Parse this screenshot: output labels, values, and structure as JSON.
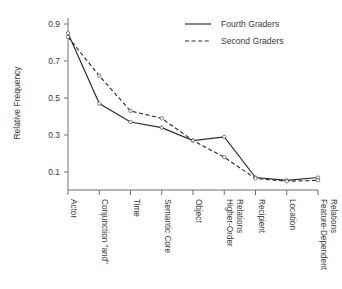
{
  "chart_data": {
    "type": "line",
    "title": "",
    "xlabel": "",
    "ylabel": "Relative Frequency",
    "ylim": [
      0.0,
      0.95
    ],
    "yticks": [
      "0.1",
      "0.3",
      "0.5",
      "0.7",
      "0.9"
    ],
    "ytick_values": [
      0.1,
      0.3,
      0.5,
      0.7,
      0.9
    ],
    "grid": false,
    "legend_position": "top-right",
    "categories": [
      "Actor",
      "Conjunction \"and\"",
      "Time",
      "Semantic Core",
      "Object",
      "Higher-Order Relations",
      "Recipient",
      "Location",
      "Feature-Dependent Relations"
    ],
    "category_lines": [
      [
        "Actor"
      ],
      [
        "Conjunction \"and\""
      ],
      [
        "Time"
      ],
      [
        "Semantic Core"
      ],
      [
        "Object"
      ],
      [
        "Higher-Order",
        "Relations"
      ],
      [
        "Recipient"
      ],
      [
        "Location"
      ],
      [
        "Feature-Dependent",
        "Relations"
      ]
    ],
    "series": [
      {
        "name": "Fourth Graders",
        "style": "solid",
        "values": [
          0.85,
          0.47,
          0.37,
          0.34,
          0.27,
          0.29,
          0.07,
          0.055,
          0.07
        ]
      },
      {
        "name": "Second Graders",
        "style": "dashed",
        "values": [
          0.83,
          0.62,
          0.43,
          0.39,
          0.27,
          0.18,
          0.065,
          0.05,
          0.055
        ]
      }
    ]
  },
  "legend": {
    "entries": [
      {
        "label": "Fourth Graders",
        "style": "solid"
      },
      {
        "label": "Second Graders",
        "style": "dashed"
      }
    ]
  },
  "colors": {
    "line": "#2b2b2b",
    "axis": "#6f6f6f",
    "text": "#3a3a3a",
    "background": "#ffffff"
  }
}
